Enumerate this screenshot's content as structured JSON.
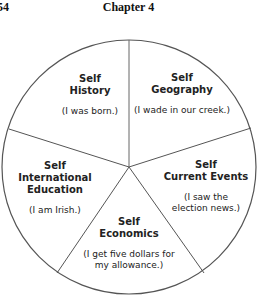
{
  "header": {
    "page_number": "54",
    "chapter": "Chapter 4"
  },
  "diagram": {
    "type": "pie-wheel",
    "segments": [
      {
        "title_line1": "Self",
        "title_line2": "History",
        "title_line3": "",
        "example_line1": "(I was born.)",
        "example_line2": ""
      },
      {
        "title_line1": "Self",
        "title_line2": "Geography",
        "title_line3": "",
        "example_line1": "(I wade in our creek.)",
        "example_line2": ""
      },
      {
        "title_line1": "Self",
        "title_line2": "Current Events",
        "title_line3": "",
        "example_line1": "(I saw the",
        "example_line2": "election news.)"
      },
      {
        "title_line1": "Self",
        "title_line2": "Economics",
        "title_line3": "",
        "example_line1": "(I get five dollars for",
        "example_line2": "my allowance.)"
      },
      {
        "title_line1": "Self",
        "title_line2": "International",
        "title_line3": "Education",
        "example_line1": "(I am Irish.)",
        "example_line2": ""
      }
    ],
    "line_color": "#555555"
  }
}
